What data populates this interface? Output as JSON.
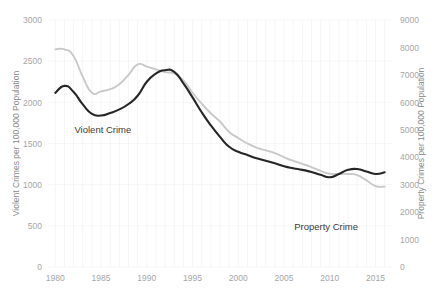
{
  "chart_data": {
    "type": "line",
    "title": "",
    "xlabel": "",
    "ylabel": "Violent Crimes per 100,000 Population",
    "y2label": "Property Crimes per 100,000 Population",
    "grid": true,
    "legend_position": "inline-annotation",
    "xlim": [
      1979.2,
      2016.8
    ],
    "ylim": [
      0,
      3000
    ],
    "y2lim": [
      0,
      9000
    ],
    "x_ticks": [
      "1980",
      "1985",
      "1990",
      "1995",
      "2000",
      "2005",
      "2010",
      "2015"
    ],
    "x_tick_values": [
      1980,
      1985,
      1990,
      1995,
      2000,
      2005,
      2010,
      2015
    ],
    "y_ticks": [
      "0",
      "500",
      "1000",
      "1500",
      "2000",
      "2500",
      "3000"
    ],
    "y_tick_values": [
      0,
      500,
      1000,
      1500,
      2000,
      2500,
      3000
    ],
    "y2_ticks": [
      "0",
      "1000",
      "2000",
      "3000",
      "4000",
      "5000",
      "6000",
      "7000",
      "8000",
      "9000"
    ],
    "y2_tick_values": [
      0,
      1000,
      2000,
      3000,
      4000,
      5000,
      6000,
      7000,
      8000,
      9000
    ],
    "x": [
      1980,
      1981,
      1982,
      1983,
      1984,
      1985,
      1986,
      1987,
      1988,
      1989,
      1990,
      1991,
      1992,
      1993,
      1994,
      1995,
      1996,
      1997,
      1998,
      1999,
      2000,
      2001,
      2002,
      2003,
      2004,
      2005,
      2006,
      2007,
      2008,
      2009,
      2010,
      2011,
      2012,
      2013,
      2014,
      2015,
      2016
    ],
    "series": [
      {
        "name": "Violent Crime",
        "axis": "left",
        "color": "#262626",
        "values": [
          2115,
          2200,
          2125,
          1975,
          1860,
          1840,
          1870,
          1915,
          1980,
          2080,
          2250,
          2350,
          2390,
          2370,
          2230,
          2060,
          1880,
          1720,
          1580,
          1460,
          1400,
          1360,
          1320,
          1290,
          1260,
          1225,
          1200,
          1180,
          1155,
          1120,
          1090,
          1130,
          1180,
          1190,
          1160,
          1130,
          1150
        ]
      },
      {
        "name": "Property Crime",
        "axis": "right",
        "color": "#c9c9c9",
        "values": [
          7930,
          7930,
          7680,
          6930,
          6350,
          6400,
          6480,
          6660,
          7000,
          7380,
          7300,
          7200,
          7100,
          7050,
          6800,
          6350,
          5950,
          5600,
          5300,
          4920,
          4700,
          4500,
          4350,
          4250,
          4150,
          4000,
          3870,
          3760,
          3640,
          3500,
          3400,
          3390,
          3390,
          3350,
          3160,
          2950,
          2930
        ]
      }
    ],
    "annotations": [
      {
        "name": "violent-crime-label",
        "text": "Violent Crime",
        "x": 1985.2,
        "y": 1630
      },
      {
        "name": "property-crime-label",
        "text": "Property Crime",
        "x": 2009.6,
        "y": 0
      }
    ]
  }
}
